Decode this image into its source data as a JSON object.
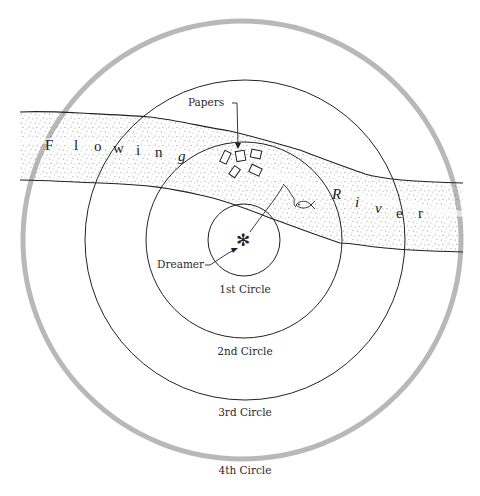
{
  "diagram": {
    "type": "concentric-circles",
    "background": "#ffffff",
    "colors": {
      "line": "#222222",
      "outer_circle": "#b5b5b5",
      "stipple": "#7a7a7a"
    },
    "center": "Dreamer",
    "center_symbol": "✻",
    "circles": [
      {
        "label": "1st Circle"
      },
      {
        "label": "2nd Circle"
      },
      {
        "label": "3rd Circle"
      },
      {
        "label": "4th Circle"
      }
    ],
    "river": {
      "label": "Flowing River",
      "words": [
        {
          "word": "Flowing",
          "letters": [
            "F",
            "l",
            "o",
            "w",
            "i",
            "n",
            "g"
          ]
        },
        {
          "word": "River",
          "letters": [
            "R",
            "i",
            "v",
            "e",
            "r"
          ]
        }
      ]
    },
    "annotations": {
      "papers": "Papers",
      "dreamer": "Dreamer"
    },
    "objects": {
      "papers_count": 5,
      "fish": "fish-icon"
    }
  }
}
